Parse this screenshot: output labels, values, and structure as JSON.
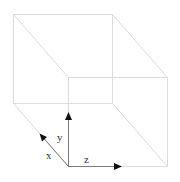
{
  "diagram": {
    "type": "3d-cube-with-axes",
    "colors": {
      "edge": "#dcdcdc",
      "axis": "#7a7a7a",
      "arrowhead": "#111111",
      "label": "#333333",
      "background": "#ffffff"
    },
    "cube": {
      "back_face": {
        "x1": 13,
        "y1": 14,
        "x2": 112,
        "y2": 103
      },
      "front_face": {
        "x1": 68,
        "y1": 77,
        "x2": 167,
        "y2": 166
      }
    },
    "axes": [
      {
        "name": "x",
        "label": "x",
        "from": [
          68,
          166
        ],
        "to": [
          40,
          134
        ]
      },
      {
        "name": "y",
        "label": "y",
        "from": [
          68,
          166
        ],
        "to": [
          68,
          114
        ]
      },
      {
        "name": "z",
        "label": "z",
        "from": [
          68,
          166
        ],
        "to": [
          120,
          166
        ]
      }
    ],
    "labels": {
      "x": "x",
      "y": "y",
      "z": "z"
    }
  }
}
